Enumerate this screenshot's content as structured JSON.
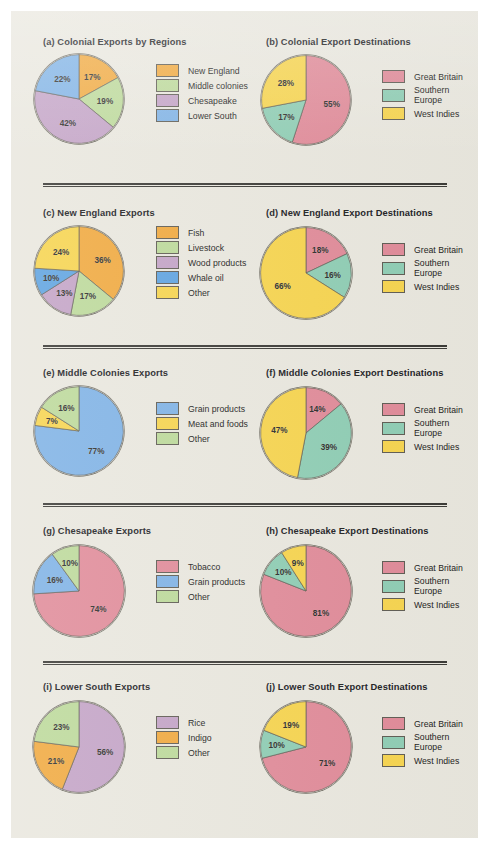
{
  "page": {
    "background_color": "#e9e7de",
    "outer_background_color": "#ffffff"
  },
  "palette": {
    "new_england": "#f0a93f",
    "middle_colonies": "#bcd99a",
    "chesapeake": "#c3a3c6",
    "lower_south": "#7fb2e5",
    "fish": "#f0a93f",
    "livestock": "#bcd99a",
    "wood_products": "#c3a3c6",
    "whale_oil": "#5fa3e0",
    "other_yellow": "#f6d44f",
    "grain_products": "#7fb2e5",
    "meat_and_foods": "#f6d44f",
    "other_green": "#bcd99a",
    "tobacco": "#e08b99",
    "rice": "#c3a3c6",
    "indigo": "#f0a93f",
    "great_britain": "#e08b99",
    "southern_europe": "#8fcdb4",
    "west_indies": "#f6d44f",
    "outline": "#5f5c53",
    "text": "#20201f"
  },
  "charts": [
    {
      "id": "a",
      "title": "(a) Colonial Exports by Regions",
      "chart_data": {
        "type": "pie",
        "title": "(a) Colonial Exports by Regions",
        "categories": [
          "New England",
          "Middle colonies",
          "Chesapeake",
          "Lower South"
        ],
        "values": [
          17,
          19,
          42,
          22
        ],
        "labels": [
          "17%",
          "19%",
          "42%",
          "22%"
        ],
        "colors": [
          "#f0a93f",
          "#bcd99a",
          "#c3a3c6",
          "#7fb2e5"
        ],
        "start_angle_deg": 0,
        "direction": "clockwise",
        "legend_position": "right",
        "units": "percent"
      }
    },
    {
      "id": "b",
      "title": "(b) Colonial Export Destinations",
      "chart_data": {
        "type": "pie",
        "title": "(b) Colonial Export Destinations",
        "categories": [
          "Great Britain",
          "Southern\nEurope",
          "West Indies"
        ],
        "values": [
          55,
          17,
          28
        ],
        "labels": [
          "55%",
          "17%",
          "28%"
        ],
        "colors": [
          "#e08b99",
          "#8fcdb4",
          "#f6d44f"
        ],
        "start_angle_deg": 0,
        "direction": "clockwise",
        "legend_position": "right",
        "units": "percent"
      }
    },
    {
      "id": "c",
      "title": "(c) New England Exports",
      "chart_data": {
        "type": "pie",
        "title": "(c) New England Exports",
        "categories": [
          "Fish",
          "Livestock",
          "Wood products",
          "Whale oil",
          "Other"
        ],
        "values": [
          36,
          17,
          13,
          10,
          24
        ],
        "labels": [
          "36%",
          "17%",
          "13%",
          "10%",
          "24%"
        ],
        "colors": [
          "#f0a93f",
          "#bcd99a",
          "#c3a3c6",
          "#5fa3e0",
          "#f6d44f"
        ],
        "start_angle_deg": 0,
        "direction": "clockwise",
        "legend_position": "right",
        "units": "percent"
      }
    },
    {
      "id": "d",
      "title": "(d) New England Export Destinations",
      "chart_data": {
        "type": "pie",
        "title": "(d) New England Export Destinations",
        "categories": [
          "Great Britain",
          "Southern\nEurope",
          "West Indies"
        ],
        "values": [
          18,
          16,
          66
        ],
        "labels": [
          "18%",
          "16%",
          "66%"
        ],
        "colors": [
          "#e08b99",
          "#8fcdb4",
          "#f6d44f"
        ],
        "start_angle_deg": 0,
        "direction": "clockwise",
        "legend_position": "right",
        "units": "percent"
      }
    },
    {
      "id": "e",
      "title": "(e) Middle Colonies Exports",
      "chart_data": {
        "type": "pie",
        "title": "(e) Middle Colonies Exports",
        "categories": [
          "Grain products",
          "Meat and foods",
          "Other"
        ],
        "values": [
          77,
          7,
          16
        ],
        "labels": [
          "77%",
          "7%",
          "16%"
        ],
        "colors": [
          "#7fb2e5",
          "#f6d44f",
          "#bcd99a"
        ],
        "start_angle_deg": 0,
        "direction": "clockwise",
        "legend_position": "right",
        "units": "percent"
      }
    },
    {
      "id": "f",
      "title": "(f) Middle Colonies Export Destinations",
      "chart_data": {
        "type": "pie",
        "title": "(f) Middle Colonies Export Destinations",
        "categories": [
          "Great Britain",
          "Southern\nEurope",
          "West Indies"
        ],
        "values": [
          14,
          39,
          47
        ],
        "labels": [
          "14%",
          "39%",
          "47%"
        ],
        "colors": [
          "#e08b99",
          "#8fcdb4",
          "#f6d44f"
        ],
        "start_angle_deg": 0,
        "direction": "clockwise",
        "legend_position": "right",
        "units": "percent"
      }
    },
    {
      "id": "g",
      "title": "(g) Chesapeake Exports",
      "chart_data": {
        "type": "pie",
        "title": "(g) Chesapeake Exports",
        "categories": [
          "Tobacco",
          "Grain products",
          "Other"
        ],
        "values": [
          74,
          16,
          10
        ],
        "labels": [
          "74%",
          "16%",
          "10%"
        ],
        "colors": [
          "#e08b99",
          "#7fb2e5",
          "#bcd99a"
        ],
        "start_angle_deg": 0,
        "direction": "clockwise",
        "legend_position": "right",
        "units": "percent"
      }
    },
    {
      "id": "h",
      "title": "(h) Chesapeake Export Destinations",
      "chart_data": {
        "type": "pie",
        "title": "(h) Chesapeake Export Destinations",
        "categories": [
          "Great Britain",
          "Southern\nEurope",
          "West Indies"
        ],
        "values": [
          81,
          10,
          9
        ],
        "labels": [
          "81%",
          "10%",
          "9%"
        ],
        "colors": [
          "#e08b99",
          "#8fcdb4",
          "#f6d44f"
        ],
        "start_angle_deg": 0,
        "direction": "clockwise",
        "legend_position": "right",
        "units": "percent"
      }
    },
    {
      "id": "i",
      "title": "(i) Lower South Exports",
      "chart_data": {
        "type": "pie",
        "title": "(i) Lower South Exports",
        "categories": [
          "Rice",
          "Indigo",
          "Other"
        ],
        "values": [
          56,
          21,
          23
        ],
        "labels": [
          "56%",
          "21%",
          "23%"
        ],
        "colors": [
          "#c3a3c6",
          "#f0a93f",
          "#bcd99a"
        ],
        "start_angle_deg": 0,
        "direction": "clockwise",
        "legend_position": "right",
        "units": "percent"
      }
    },
    {
      "id": "j",
      "title": "(j) Lower South Export Destinations",
      "chart_data": {
        "type": "pie",
        "title": "(j) Lower South Export Destinations",
        "categories": [
          "Great Britain",
          "Southern\nEurope",
          "West Indies"
        ],
        "values": [
          71,
          10,
          19
        ],
        "labels": [
          "71%",
          "10%",
          "19%"
        ],
        "colors": [
          "#e08b99",
          "#8fcdb4",
          "#f6d44f"
        ],
        "start_angle_deg": 0,
        "direction": "clockwise",
        "legend_position": "right",
        "units": "percent"
      }
    }
  ],
  "layout": {
    "rows": [
      {
        "top": 25,
        "divider_top": 172
      },
      {
        "top": 196,
        "divider_top": 334
      },
      {
        "top": 356,
        "divider_top": 492
      },
      {
        "top": 514,
        "divider_top": 650
      },
      {
        "top": 670,
        "divider_top": null
      }
    ],
    "pie": [
      {
        "id": "a",
        "cx": 50,
        "cy": 47,
        "r": 45,
        "legend_left": 127,
        "legend_top": 12
      },
      {
        "id": "b",
        "cx": 52,
        "cy": 48,
        "r": 45,
        "legend_left": 128,
        "legend_top": 18
      },
      {
        "id": "c",
        "cx": 50,
        "cy": 48,
        "r": 45,
        "legend_left": 127,
        "legend_top": 3
      },
      {
        "id": "d",
        "cx": 52,
        "cy": 50,
        "r": 46,
        "legend_left": 128,
        "legend_top": 20
      },
      {
        "id": "e",
        "cx": 50,
        "cy": 48,
        "r": 45,
        "legend_left": 127,
        "legend_top": 19
      },
      {
        "id": "f",
        "cx": 52,
        "cy": 50,
        "r": 46,
        "legend_left": 128,
        "legend_top": 20
      },
      {
        "id": "g",
        "cx": 50,
        "cy": 50,
        "r": 46,
        "legend_left": 127,
        "legend_top": 19
      },
      {
        "id": "h",
        "cx": 52,
        "cy": 50,
        "r": 46,
        "legend_left": 128,
        "legend_top": 20
      },
      {
        "id": "i",
        "cx": 50,
        "cy": 50,
        "r": 46,
        "legend_left": 127,
        "legend_top": 19
      },
      {
        "id": "j",
        "cx": 52,
        "cy": 50,
        "r": 46,
        "legend_left": 128,
        "legend_top": 20
      }
    ]
  }
}
